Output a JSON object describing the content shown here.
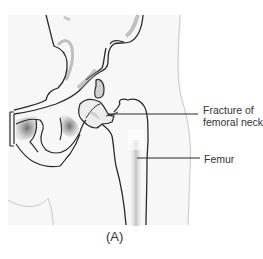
{
  "figure": {
    "caption": "(A)",
    "labels": [
      {
        "text": "Fracture of\nfemoral neck",
        "line1": "Fracture of",
        "line2": "femoral neck"
      },
      {
        "text": "Femur"
      }
    ],
    "colors": {
      "outline": "#2a2a2a",
      "shade": "#8a8a8a",
      "skin_outline": "#bdbdbd",
      "background": "#f7f7f7",
      "text": "#333333"
    }
  }
}
